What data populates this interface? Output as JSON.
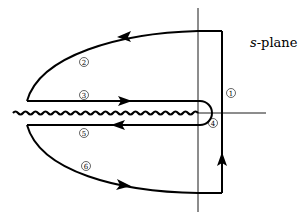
{
  "diagram": {
    "title": "s-plane",
    "title_italic_part": "s",
    "title_rest": "-plane",
    "segments": [
      {
        "id": 1,
        "label": "1",
        "description": "vertical line to the right of imaginary axis, directed upward"
      },
      {
        "id": 2,
        "label": "2",
        "description": "upper large arc, directed leftward/counterclockwise"
      },
      {
        "id": 3,
        "label": "3",
        "description": "upper side of branch cut, directed rightward toward origin"
      },
      {
        "id": 4,
        "label": "4",
        "description": "small circle around origin"
      },
      {
        "id": 5,
        "label": "5",
        "description": "lower side of branch cut, directed leftward away from origin"
      },
      {
        "id": 6,
        "label": "6",
        "description": "lower large arc, directed rightward"
      }
    ],
    "branch_cut": "wavy line along negative real axis",
    "colors": {
      "stroke": "#000000",
      "background": "#ffffff"
    }
  }
}
